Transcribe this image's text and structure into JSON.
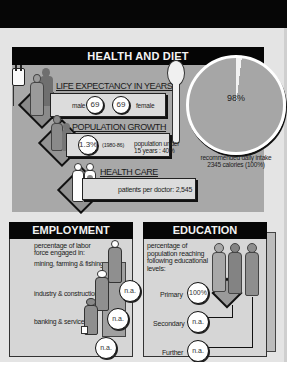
{
  "health_and_diet": {
    "title": "HEALTH AND DIET",
    "life_expectancy": {
      "label": "LIFE EXPECTANCY IN YEARS",
      "male_label": "male",
      "male_value": "69",
      "female_value": "69",
      "female_label": "female"
    },
    "population_growth": {
      "label": "POPULATION GROWTH",
      "value": "1.3%",
      "period": "(1980-86)",
      "under15_line1": "population under",
      "under15_line2": "15 years : 40%"
    },
    "health_care": {
      "label": "HEALTH CARE",
      "patients_per_doctor": "patients per doctor: 2,545"
    },
    "diet": {
      "pie_value": "98%",
      "caption_line1": "recommended daily intake",
      "caption_line2": "2345 calories (100%)"
    }
  },
  "employment": {
    "title": "EMPLOYMENT",
    "intro_line1": "percentage of labor",
    "intro_line2": "force engaged in:",
    "sectors": [
      {
        "label": "mining, farming & fishing",
        "value": "n.a."
      },
      {
        "label": "industry & construction",
        "value": "n.a."
      },
      {
        "label": "banking & services",
        "value": "n.a."
      }
    ]
  },
  "education": {
    "title": "EDUCATION",
    "intro_line1": "percentage of",
    "intro_line2": "population reaching",
    "intro_line3": "following educational",
    "intro_line4": "levels:",
    "levels": [
      {
        "label": "Primary",
        "value": "100%"
      },
      {
        "label": "Secondary",
        "value": "n.a."
      },
      {
        "label": "Further",
        "value": "n.a."
      }
    ]
  },
  "colors": {
    "header_black": "#050505",
    "panel_gray": "#a8a8a8",
    "box_light": "#dcdcdc",
    "page_bg": "#e4e4e4"
  }
}
